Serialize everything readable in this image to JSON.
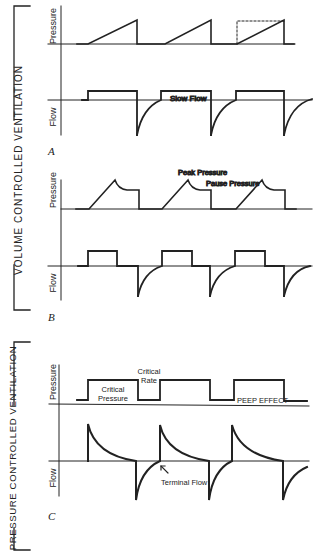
{
  "brackets": {
    "volume": "VOLUME   CONTROLLED   VENTILATION",
    "pressure": "PRESSURE CONTROLLED VENTILATION"
  },
  "axis_labels": {
    "pressure": "Pressure",
    "flow": "Flow"
  },
  "panels": {
    "a": {
      "letter": "A",
      "annotations": {
        "slow_flow": "Slow Flow"
      }
    },
    "b": {
      "letter": "B",
      "annotations": {
        "peak_pressure": "Peak Pressure",
        "pause_pressure": "Pause Pressure"
      }
    },
    "c": {
      "letter": "C",
      "annotations": {
        "critical_rate_1": "Critical",
        "critical_rate_2": "Rate",
        "critical_pressure_1": "Critical",
        "critical_pressure_2": "Pressure",
        "peep_effect": "PEEP EFFECT",
        "terminal_flow": "Terminal Flow"
      }
    }
  }
}
